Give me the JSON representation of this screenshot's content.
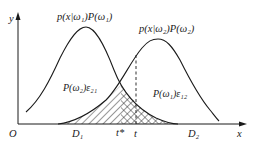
{
  "diagram": {
    "axes": {
      "y_label": "y",
      "x_label": "x",
      "origin_label": "O"
    },
    "curves": [
      {
        "name": "class1",
        "label": "p(x|ω₁)P(ω₁)"
      },
      {
        "name": "class2",
        "label": "p(x|ω₂)P(ω₂)"
      }
    ],
    "regions": {
      "d1": "D₁",
      "d2": "D₂"
    },
    "thresholds": {
      "t_star": "t*",
      "t": "t"
    },
    "error_areas": {
      "e21": "P(ω₂)ε₂₁",
      "e12": "P(ω₁)ε₁₂"
    },
    "colors": {
      "line": "#1a1a1a",
      "background": "#ffffff"
    }
  }
}
